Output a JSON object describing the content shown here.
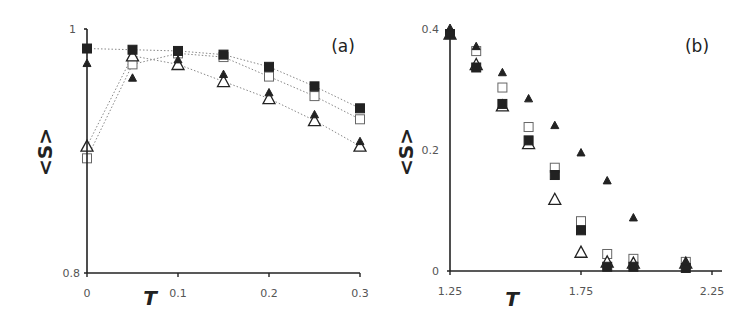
{
  "chart_data": [
    {
      "type": "line",
      "panel_label": "(a)",
      "xlabel": "T",
      "ylabel": "<S>",
      "xlim": [
        0,
        0.3
      ],
      "ylim": [
        0.8,
        1.0
      ],
      "x_ticks": [
        "0",
        "0.1",
        "0.2",
        "0.3"
      ],
      "y_ticks": [
        "0.8",
        "1"
      ],
      "grid": false,
      "legend": null,
      "x": [
        0,
        0.05,
        0.1,
        0.15,
        0.2,
        0.25,
        0.3
      ],
      "series": [
        {
          "name": "filled-square",
          "marker": "square-filled",
          "dotted_line": true,
          "values": [
            0.984,
            0.983,
            0.982,
            0.979,
            0.969,
            0.953,
            0.935
          ]
        },
        {
          "name": "open-square",
          "marker": "square-open",
          "dotted_line": true,
          "values": [
            0.894,
            0.971,
            0.98,
            0.977,
            0.961,
            0.945,
            0.926
          ]
        },
        {
          "name": "filled-triangle",
          "marker": "triangle-filled",
          "dotted_line": false,
          "values": [
            0.972,
            0.96,
            0.975,
            0.963,
            0.948,
            0.93,
            0.908
          ]
        },
        {
          "name": "open-triangle",
          "marker": "triangle-open",
          "dotted_line": true,
          "values": [
            0.904,
            0.978,
            0.971,
            0.957,
            0.943,
            0.925,
            0.904
          ]
        }
      ]
    },
    {
      "type": "scatter",
      "panel_label": "(b)",
      "xlabel": "T",
      "ylabel": "<S>",
      "xlim": [
        1.25,
        2.3
      ],
      "ylim": [
        0,
        0.4
      ],
      "x_ticks": [
        "1.25",
        "1.75",
        "2.25"
      ],
      "y_ticks": [
        "0",
        "0.2",
        "0.4"
      ],
      "grid": false,
      "legend": null,
      "x": [
        1.25,
        1.35,
        1.45,
        1.55,
        1.65,
        1.75,
        1.85,
        1.95,
        2.15
      ],
      "series": [
        {
          "name": "filled-square",
          "marker": "square-filled",
          "values": [
            0.39,
            0.335,
            0.275,
            0.215,
            0.158,
            0.067,
            0.007,
            0.007,
            0.005
          ]
        },
        {
          "name": "open-square",
          "marker": "square-open",
          "values": [
            0.39,
            0.362,
            0.302,
            0.237,
            0.17,
            0.082,
            0.028,
            0.02,
            0.015
          ]
        },
        {
          "name": "filled-triangle",
          "marker": "triangle-filled",
          "values": [
            0.4,
            0.37,
            0.327,
            0.284,
            0.24,
            0.195,
            0.149,
            0.088,
            0.015
          ]
        },
        {
          "name": "open-triangle",
          "marker": "triangle-open",
          "values": [
            0.39,
            0.34,
            0.272,
            0.21,
            0.118,
            0.031,
            0.015,
            0.013,
            0.013
          ]
        }
      ]
    }
  ]
}
